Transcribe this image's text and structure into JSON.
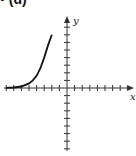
{
  "panel": {
    "label": "• (d)"
  },
  "chart_data": {
    "type": "line",
    "title": "",
    "xlabel": "x",
    "ylabel": "y",
    "xlim": [
      -8,
      8
    ],
    "ylim": [
      -8,
      8
    ],
    "grid": false,
    "tick_spacing": 1,
    "series": [
      {
        "name": "exponential growth curve",
        "x": [
          -8,
          -7,
          -6,
          -5,
          -4.5,
          -4,
          -3.5,
          -3,
          -2.5,
          -2
        ],
        "y": [
          0.02,
          0.06,
          0.2,
          0.6,
          1.0,
          1.6,
          2.6,
          4.0,
          5.6,
          7.0
        ]
      }
    ]
  },
  "colors": {
    "axis": "#333333",
    "curve": "#111111"
  }
}
